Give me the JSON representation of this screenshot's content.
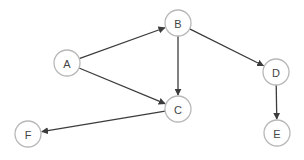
{
  "diagram": {
    "type": "directed-graph",
    "colors": {
      "edge": "#3c3c3c",
      "node_border": "#b8b8b8",
      "node_fill": "#ffffff",
      "label": "#444444"
    },
    "node_radius": 13,
    "nodes": [
      {
        "id": "A",
        "label": "A",
        "x": 67,
        "y": 63
      },
      {
        "id": "B",
        "label": "B",
        "x": 178,
        "y": 23
      },
      {
        "id": "C",
        "label": "C",
        "x": 178,
        "y": 109
      },
      {
        "id": "D",
        "label": "D",
        "x": 276,
        "y": 72
      },
      {
        "id": "E",
        "label": "E",
        "x": 277,
        "y": 133
      },
      {
        "id": "F",
        "label": "F",
        "x": 28,
        "y": 134
      }
    ],
    "edges": [
      {
        "from": "A",
        "to": "B"
      },
      {
        "from": "A",
        "to": "C"
      },
      {
        "from": "B",
        "to": "C"
      },
      {
        "from": "B",
        "to": "D"
      },
      {
        "from": "C",
        "to": "F"
      },
      {
        "from": "D",
        "to": "E"
      }
    ]
  }
}
